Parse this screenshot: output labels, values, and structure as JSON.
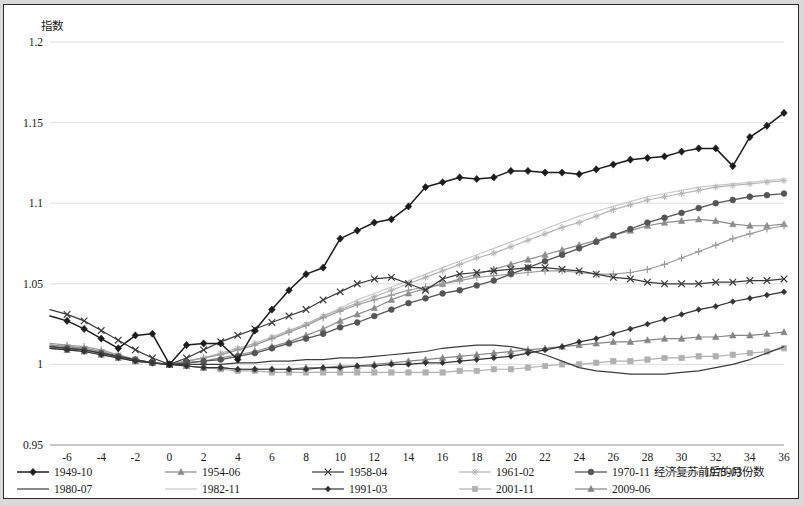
{
  "chart_data": {
    "type": "line",
    "title": "",
    "ylabel": "指数",
    "xlabel": "经济复苏前后的月份数",
    "ylim": [
      0.95,
      1.2
    ],
    "yticks": [
      "0.95",
      "1",
      "1.05",
      "1.1",
      "1.15",
      "1.2"
    ],
    "ytick_values": [
      0.95,
      1.0,
      1.05,
      1.1,
      1.15,
      1.2
    ],
    "xlim": [
      -7,
      36
    ],
    "xticks": [
      "-6",
      "-4",
      "-2",
      "0",
      "2",
      "4",
      "6",
      "8",
      "10",
      "12",
      "14",
      "16",
      "18",
      "20",
      "22",
      "24",
      "26",
      "28",
      "30",
      "32",
      "34",
      "36"
    ],
    "xtick_values": [
      -6,
      -4,
      -2,
      0,
      2,
      4,
      6,
      8,
      10,
      12,
      14,
      16,
      18,
      20,
      22,
      24,
      26,
      28,
      30,
      32,
      34,
      36
    ],
    "grid": true,
    "legend_position": "bottom",
    "x": [
      -7,
      -6,
      -5,
      -4,
      -3,
      -2,
      -1,
      0,
      1,
      2,
      3,
      4,
      5,
      6,
      7,
      8,
      9,
      10,
      11,
      12,
      13,
      14,
      15,
      16,
      17,
      18,
      19,
      20,
      21,
      22,
      23,
      24,
      25,
      26,
      27,
      28,
      29,
      30,
      31,
      32,
      33,
      34,
      35,
      36
    ],
    "series": [
      {
        "name": "1949-10",
        "color": "#1c1c1c",
        "marker": "diamond",
        "width": 1.5,
        "values": [
          1.03,
          1.027,
          1.022,
          1.016,
          1.01,
          1.018,
          1.019,
          1.0,
          1.012,
          1.013,
          1.013,
          1.003,
          1.021,
          1.034,
          1.046,
          1.056,
          1.06,
          1.078,
          1.083,
          1.088,
          1.09,
          1.098,
          1.11,
          1.113,
          1.116,
          1.115,
          1.116,
          1.12,
          1.12,
          1.119,
          1.119,
          1.118,
          1.121,
          1.124,
          1.127,
          1.128,
          1.129,
          1.132,
          1.134,
          1.134,
          1.123,
          1.141,
          1.148,
          1.156
        ]
      },
      {
        "name": "1954-06",
        "color": "#8c8c8c",
        "marker": "triangle",
        "width": 1.2,
        "values": [
          1.012,
          1.011,
          1.01,
          1.008,
          1.005,
          1.002,
          1.001,
          1.0,
          1.001,
          1.002,
          1.004,
          1.006,
          1.008,
          1.011,
          1.014,
          1.018,
          1.022,
          1.027,
          1.031,
          1.035,
          1.04,
          1.044,
          1.047,
          1.05,
          1.053,
          1.056,
          1.059,
          1.062,
          1.065,
          1.068,
          1.071,
          1.074,
          1.077,
          1.08,
          1.083,
          1.086,
          1.088,
          1.089,
          1.09,
          1.089,
          1.087,
          1.086,
          1.086,
          1.087
        ]
      },
      {
        "name": "1958-04",
        "color": "#3a3a3a",
        "marker": "x",
        "width": 1.2,
        "values": [
          1.034,
          1.031,
          1.027,
          1.021,
          1.015,
          1.009,
          1.004,
          1.0,
          1.004,
          1.009,
          1.014,
          1.018,
          1.022,
          1.026,
          1.03,
          1.034,
          1.04,
          1.045,
          1.05,
          1.053,
          1.054,
          1.05,
          1.046,
          1.053,
          1.056,
          1.057,
          1.058,
          1.059,
          1.06,
          1.06,
          1.059,
          1.058,
          1.056,
          1.054,
          1.053,
          1.051,
          1.05,
          1.05,
          1.05,
          1.051,
          1.051,
          1.052,
          1.052,
          1.053
        ]
      },
      {
        "name": "1961-02",
        "color": "#b5b5b5",
        "marker": "star",
        "width": 1.2,
        "values": [
          1.012,
          1.011,
          1.01,
          1.008,
          1.006,
          1.003,
          1.001,
          1.0,
          1.002,
          1.004,
          1.007,
          1.01,
          1.013,
          1.017,
          1.021,
          1.025,
          1.03,
          1.034,
          1.038,
          1.042,
          1.046,
          1.05,
          1.054,
          1.058,
          1.062,
          1.066,
          1.069,
          1.073,
          1.077,
          1.081,
          1.085,
          1.088,
          1.092,
          1.096,
          1.099,
          1.102,
          1.104,
          1.106,
          1.108,
          1.11,
          1.111,
          1.112,
          1.113,
          1.114
        ]
      },
      {
        "name": "1970-11",
        "color": "#555555",
        "marker": "circle",
        "width": 1.3,
        "values": [
          1.011,
          1.01,
          1.009,
          1.007,
          1.005,
          1.003,
          1.001,
          1.0,
          1.001,
          1.002,
          1.003,
          1.005,
          1.007,
          1.01,
          1.013,
          1.016,
          1.019,
          1.023,
          1.026,
          1.03,
          1.034,
          1.038,
          1.041,
          1.044,
          1.046,
          1.049,
          1.052,
          1.056,
          1.06,
          1.064,
          1.068,
          1.072,
          1.076,
          1.08,
          1.084,
          1.088,
          1.091,
          1.094,
          1.097,
          1.1,
          1.102,
          1.104,
          1.105,
          1.106
        ]
      },
      {
        "name": "1975-03",
        "color": "#9c9c9c",
        "marker": "plus",
        "width": 1.2,
        "values": [
          1.013,
          1.012,
          1.011,
          1.009,
          1.006,
          1.003,
          1.001,
          1.0,
          1.002,
          1.004,
          1.006,
          1.009,
          1.012,
          1.016,
          1.02,
          1.024,
          1.029,
          1.033,
          1.037,
          1.04,
          1.043,
          1.046,
          1.048,
          1.05,
          1.052,
          1.054,
          1.055,
          1.056,
          1.057,
          1.058,
          1.058,
          1.057,
          1.056,
          1.056,
          1.057,
          1.059,
          1.062,
          1.066,
          1.07,
          1.074,
          1.078,
          1.081,
          1.084,
          1.086
        ]
      },
      {
        "name": "1980-07",
        "color": "#3c3c3c",
        "marker": "none",
        "width": 1.2,
        "values": [
          1.011,
          1.01,
          1.009,
          1.007,
          1.005,
          1.003,
          1.001,
          1.0,
          1.0,
          1.0,
          1.0,
          1.001,
          1.001,
          1.002,
          1.002,
          1.003,
          1.003,
          1.004,
          1.004,
          1.005,
          1.006,
          1.007,
          1.008,
          1.01,
          1.011,
          1.012,
          1.012,
          1.011,
          1.009,
          1.006,
          1.002,
          0.998,
          0.996,
          0.995,
          0.994,
          0.994,
          0.994,
          0.995,
          0.996,
          0.998,
          1.0,
          1.003,
          1.007,
          1.011
        ]
      },
      {
        "name": "1982-11",
        "color": "#c9c9c9",
        "marker": "none",
        "width": 1.2,
        "values": [
          1.012,
          1.011,
          1.01,
          1.008,
          1.006,
          1.003,
          1.001,
          1.0,
          1.002,
          1.004,
          1.006,
          1.009,
          1.012,
          1.016,
          1.02,
          1.025,
          1.03,
          1.035,
          1.04,
          1.044,
          1.048,
          1.052,
          1.056,
          1.06,
          1.064,
          1.068,
          1.072,
          1.076,
          1.08,
          1.084,
          1.088,
          1.092,
          1.095,
          1.098,
          1.101,
          1.104,
          1.106,
          1.108,
          1.11,
          1.111,
          1.112,
          1.113,
          1.114,
          1.115
        ]
      },
      {
        "name": "1991-03",
        "color": "#333333",
        "marker": "smalldiamond",
        "width": 1.2,
        "values": [
          1.01,
          1.009,
          1.008,
          1.006,
          1.004,
          1.002,
          1.001,
          1.0,
          0.999,
          0.998,
          0.998,
          0.997,
          0.997,
          0.997,
          0.997,
          0.997,
          0.998,
          0.998,
          0.999,
          0.999,
          1.0,
          1.0,
          1.001,
          1.001,
          1.002,
          1.003,
          1.004,
          1.005,
          1.007,
          1.009,
          1.011,
          1.014,
          1.016,
          1.019,
          1.022,
          1.025,
          1.028,
          1.031,
          1.034,
          1.036,
          1.039,
          1.041,
          1.043,
          1.045
        ]
      },
      {
        "name": "2001-11",
        "color": "#b0b0b0",
        "marker": "square",
        "width": 1.2,
        "values": [
          1.011,
          1.01,
          1.009,
          1.007,
          1.005,
          1.003,
          1.001,
          1.0,
          0.999,
          0.998,
          0.997,
          0.996,
          0.996,
          0.995,
          0.995,
          0.995,
          0.995,
          0.995,
          0.995,
          0.995,
          0.995,
          0.995,
          0.995,
          0.995,
          0.996,
          0.996,
          0.997,
          0.997,
          0.998,
          0.999,
          1.0,
          1.0,
          1.001,
          1.002,
          1.002,
          1.003,
          1.004,
          1.004,
          1.005,
          1.005,
          1.006,
          1.007,
          1.008,
          1.01
        ]
      },
      {
        "name": "2009-06",
        "color": "#858585",
        "marker": "triangle",
        "width": 1.2,
        "values": [
          1.01,
          1.009,
          1.008,
          1.006,
          1.004,
          1.002,
          1.001,
          1.0,
          0.999,
          0.998,
          0.998,
          0.997,
          0.997,
          0.997,
          0.997,
          0.998,
          0.998,
          0.999,
          0.999,
          1.0,
          1.001,
          1.002,
          1.003,
          1.004,
          1.005,
          1.006,
          1.007,
          1.008,
          1.009,
          1.01,
          1.011,
          1.012,
          1.013,
          1.014,
          1.014,
          1.015,
          1.016,
          1.016,
          1.017,
          1.017,
          1.018,
          1.018,
          1.019,
          1.02
        ]
      }
    ]
  },
  "legend": {
    "row1": [
      "1949-10",
      "1954-06",
      "1958-04",
      "1961-02",
      "1970-11",
      "1975-03"
    ],
    "row2": [
      "1980-07",
      "1982-11",
      "1991-03",
      "2001-11",
      "2009-06"
    ]
  }
}
